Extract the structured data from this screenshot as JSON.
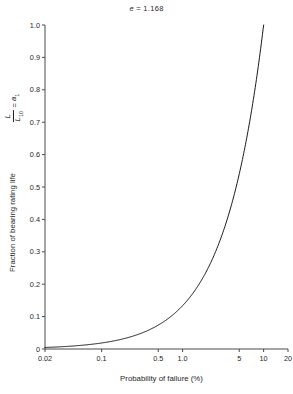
{
  "chart_data": {
    "type": "line",
    "title_symbol": "e",
    "title_value": "1.168",
    "xlabel": "Probability of failure (%)",
    "ylabel": "Fraction of bearing rating life",
    "ylabel_formula_numerator": "L",
    "ylabel_formula_denominator": "L",
    "ylabel_formula_denominator_sub": "10",
    "ylabel_formula_equals": "=",
    "ylabel_formula_result": "a",
    "ylabel_formula_result_sub": "1",
    "xscale": "log",
    "yscale": "linear",
    "xlim": [
      0.02,
      20
    ],
    "ylim": [
      0,
      1.0
    ],
    "grid": false,
    "legend": "none",
    "xticks": [
      0.02,
      0.1,
      0.5,
      1.0,
      5,
      10,
      20
    ],
    "xtick_labels": [
      "0.02",
      "0.1",
      "0.5",
      "1.0",
      "5",
      "10",
      "20"
    ],
    "yticks": [
      0,
      0.1,
      0.2,
      0.3,
      0.4,
      0.5,
      0.6,
      0.7,
      0.8,
      0.9,
      1.0
    ],
    "ytick_labels": [
      "0",
      "0.1",
      "0.2",
      "0.3",
      "0.4",
      "0.5",
      "0.6",
      "0.7",
      "0.8",
      "0.9",
      "1.0"
    ],
    "series": [
      {
        "name": "a1 life adjustment factor",
        "x": [
          0.02,
          0.03,
          0.05,
          0.07,
          0.1,
          0.15,
          0.2,
          0.3,
          0.5,
          0.7,
          1.0,
          1.5,
          2.0,
          3.0,
          4.0,
          5.0,
          6.0,
          7.0,
          8.0,
          9.0,
          10.0
        ],
        "y": [
          0.035,
          0.05,
          0.076,
          0.1,
          0.136,
          0.19,
          0.237,
          0.32,
          0.46,
          0.58,
          0.73,
          0.94,
          1.0,
          1.0,
          1.0,
          1.0,
          1.0,
          1.0,
          1.0,
          1.0,
          1.0
        ]
      }
    ],
    "line_color": "#000000",
    "background_color": "#ffffff",
    "axis_color": "#4a4a4a",
    "text_color": "#1f1f1f"
  },
  "plot_geometry": {
    "left_px": 45,
    "right_px": 288,
    "top_px": 25,
    "bottom_px": 349
  }
}
